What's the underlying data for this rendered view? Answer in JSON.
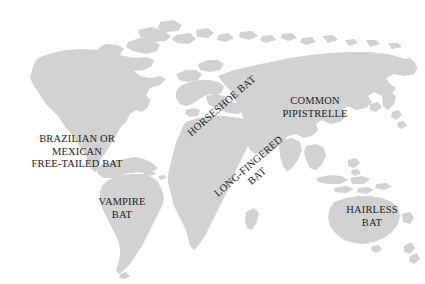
{
  "figure": {
    "type": "world-distribution-map",
    "background_color": "#ffffff",
    "land_color": "#d2d2d2",
    "label_color": "#1c1c1c"
  },
  "labels": [
    {
      "id": "brazilian-mexican-free-tailed-bat",
      "lines": [
        "BRAZILIAN OR",
        "MEXICAN",
        "FREE-TAILED BAT"
      ],
      "rotation_deg": 0,
      "region": "North America"
    },
    {
      "id": "vampire-bat",
      "lines": [
        "VAMPIRE",
        "BAT"
      ],
      "rotation_deg": 0,
      "region": "South America"
    },
    {
      "id": "horseshoe-bat",
      "lines": [
        "HORSESHOE BAT"
      ],
      "rotation_deg": -41,
      "region": "Europe"
    },
    {
      "id": "long-fingered-bat",
      "lines": [
        "LONG-FINGERED",
        "BAT"
      ],
      "rotation_deg": -41,
      "region": "Mediterranean / Middle East"
    },
    {
      "id": "common-pipistrelle",
      "lines": [
        "COMMON",
        "PIPISTRELLE"
      ],
      "rotation_deg": 0,
      "region": "Asia"
    },
    {
      "id": "hairless-bat",
      "lines": [
        "HAIRLESS",
        "BAT"
      ],
      "rotation_deg": 0,
      "region": "Southeast Asia / Australia"
    }
  ]
}
